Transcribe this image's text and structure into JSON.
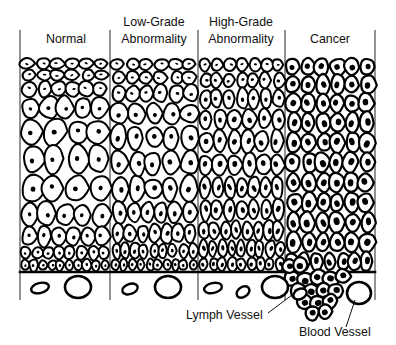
{
  "figure": {
    "width": 396,
    "height": 345,
    "background_color": "#ffffff",
    "ink_color": "#000000",
    "divider_color": "#3a3a3a"
  },
  "stages": [
    {
      "id": "normal",
      "label": "Normal",
      "label_x": 66,
      "label_lines": [
        "Normal"
      ],
      "region_x0": 20,
      "region_x1": 110
    },
    {
      "id": "low",
      "label": "Low-Grade Abnormality",
      "label_x": 154,
      "label_lines": [
        "Low-Grade",
        "Abnormality"
      ],
      "region_x0": 110,
      "region_x1": 198
    },
    {
      "id": "high",
      "label": "High-Grade Abnormality",
      "label_x": 241,
      "label_lines": [
        "High-Grade",
        "Abnormality"
      ],
      "region_x0": 198,
      "region_x1": 285
    },
    {
      "id": "cancer",
      "label": "Cancer",
      "label_x": 330,
      "label_lines": [
        "Cancer"
      ],
      "region_x0": 285,
      "region_x1": 375
    }
  ],
  "dividers": [
    {
      "x": 20,
      "y0": 30,
      "y1": 300
    },
    {
      "x": 110,
      "y0": 30,
      "y1": 300
    },
    {
      "x": 198,
      "y0": 30,
      "y1": 300
    },
    {
      "x": 285,
      "y0": 30,
      "y1": 300
    },
    {
      "x": 375,
      "y0": 30,
      "y1": 300
    }
  ],
  "basement_membrane": {
    "x0": 20,
    "x1": 375,
    "y": 272,
    "breach_x0": 285,
    "breach_x1": 345
  },
  "callouts": [
    {
      "id": "lymph-vessel",
      "label": "Lymph Vessel",
      "text_x": 186,
      "text_y": 319,
      "leader": {
        "x1": 268,
        "y1": 313,
        "x2": 296,
        "y2": 292
      }
    },
    {
      "id": "blood-vessel",
      "label": "Blood Vessel",
      "text_x": 299,
      "text_y": 336,
      "leader": {
        "x1": 346,
        "y1": 327,
        "x2": 355,
        "y2": 300
      }
    }
  ],
  "vessels": [
    {
      "type": "lymph",
      "cx": 40,
      "cy": 288,
      "rx": 9,
      "ry": 5,
      "rot": -14
    },
    {
      "type": "blood",
      "cx": 78,
      "cy": 287,
      "rx": 13,
      "ry": 11,
      "rot": 0
    },
    {
      "type": "lymph",
      "cx": 130,
      "cy": 289,
      "rx": 8,
      "ry": 5,
      "rot": -20
    },
    {
      "type": "blood",
      "cx": 168,
      "cy": 287,
      "rx": 13,
      "ry": 11,
      "rot": 0
    },
    {
      "type": "lymph",
      "cx": 213,
      "cy": 288,
      "rx": 9,
      "ry": 5,
      "rot": -12
    },
    {
      "type": "lymph",
      "cx": 243,
      "cy": 292,
      "rx": 7,
      "ry": 5,
      "rot": -35
    },
    {
      "type": "blood",
      "cx": 275,
      "cy": 287,
      "rx": 13,
      "ry": 11,
      "rot": 0
    },
    {
      "type": "lymph",
      "cx": 300,
      "cy": 294,
      "rx": 7,
      "ry": 5,
      "rot": -28
    },
    {
      "type": "blood",
      "cx": 359,
      "cy": 293,
      "rx": 12,
      "ry": 11,
      "rot": 0
    }
  ],
  "legend_notes": {
    "epithelium_top_y": 58,
    "epithelium_bottom_y": 272,
    "description": "Stratified epithelium becomes progressively disorganized left to right; cancer cells breach the basement membrane and invade the stroma."
  }
}
